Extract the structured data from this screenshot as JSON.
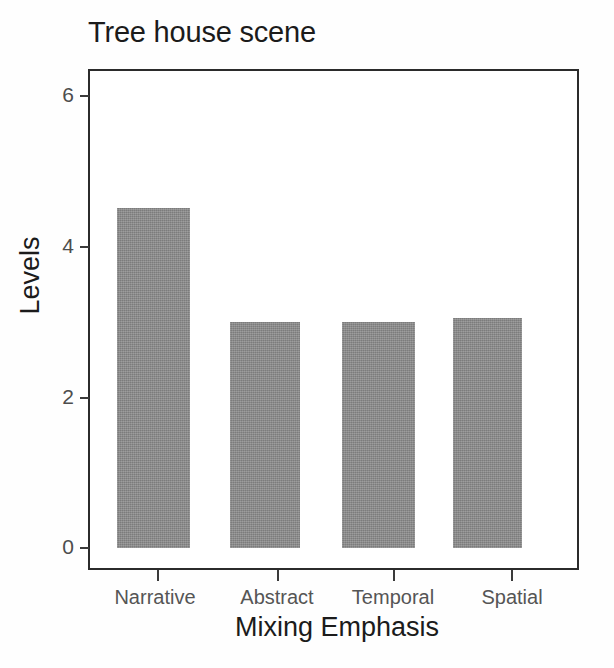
{
  "chart_data": {
    "type": "bar",
    "title": "Tree house scene",
    "xlabel": "Mixing Emphasis",
    "ylabel": "Levels",
    "categories": [
      "Narrative",
      "Abstract",
      "Temporal",
      "Spatial"
    ],
    "values": [
      4.5,
      3.0,
      3.0,
      3.05
    ],
    "ylim": [
      0,
      6.4
    ],
    "yticks": [
      0,
      2,
      4,
      6
    ],
    "ytick_labels": [
      "0",
      "2",
      "4",
      "6"
    ],
    "grid": false,
    "legend": null,
    "bar_color": "#8b8b8b",
    "frame_color": "#2b2b2b",
    "background": "#ffffff"
  },
  "axes": {
    "y": {
      "ticks": [
        {
          "label": "6",
          "value": 6
        },
        {
          "label": "4",
          "value": 4
        },
        {
          "label": "2",
          "value": 2
        },
        {
          "label": "0",
          "value": 0
        }
      ]
    },
    "x": {
      "ticks": [
        {
          "label": "Narrative"
        },
        {
          "label": "Abstract"
        },
        {
          "label": "Temporal"
        },
        {
          "label": "Spatial"
        }
      ]
    }
  }
}
